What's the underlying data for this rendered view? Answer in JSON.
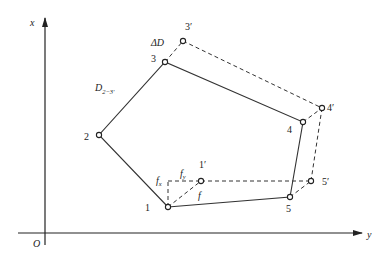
{
  "axes": {
    "x_label": "x",
    "y_label": "y",
    "origin_label": "O"
  },
  "points": {
    "p1": {
      "label": "1",
      "x": 168,
      "y": 207
    },
    "p2": {
      "label": "2",
      "x": 99,
      "y": 135
    },
    "p3": {
      "label": "3",
      "x": 165,
      "y": 62
    },
    "p4": {
      "label": "4",
      "x": 303,
      "y": 122
    },
    "p5": {
      "label": "5",
      "x": 290,
      "y": 197
    },
    "p1p": {
      "label": "1′",
      "x": 201,
      "y": 181
    },
    "p3p": {
      "label": "3′",
      "x": 183,
      "y": 41
    },
    "p4p": {
      "label": "4′",
      "x": 322,
      "y": 108
    },
    "p5p": {
      "label": "5′",
      "x": 311,
      "y": 181
    }
  },
  "annotations": {
    "delta_d": "ΔD",
    "d_main": "D",
    "d_sub": "2−3′",
    "f": "f",
    "fx": "f",
    "fx_sub": "x",
    "fy": "f",
    "fy_sub": "y"
  }
}
